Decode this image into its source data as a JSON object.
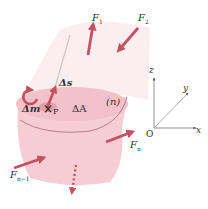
{
  "diagram": {
    "colors": {
      "arrow": "#c5505e",
      "body_fill": "#f5cdd3",
      "body_upper_fill": "#fbeef0",
      "top_surface": "#f0bcc4",
      "area_spot": "#e3a0aa",
      "axis": "#555555",
      "outline": "#a05a66"
    },
    "labels": {
      "F1": "F",
      "F1_sub": "1",
      "F2": "F",
      "F2_sub": "2",
      "Fn": "F",
      "Fn_sub": "n",
      "Fn1": "F",
      "Fn1_sub": "n−1",
      "delta_s": "Δs",
      "delta_m": "Δm",
      "point": "×",
      "point_label": "P",
      "delta_A": "ΔA",
      "region": "(n)"
    },
    "axes": {
      "x": "x",
      "y": "y",
      "z": "z",
      "origin": "O"
    }
  }
}
